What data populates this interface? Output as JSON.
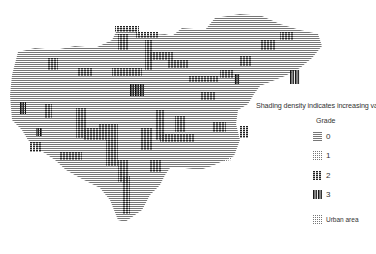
{
  "map": {
    "description": "Dot-matrix shaded map of a region showing graded areas",
    "colors": {
      "ink": "#222222",
      "background": "#ffffff"
    }
  },
  "legend": {
    "title": "Shading density indicates increasing va",
    "subtitle": "Grade",
    "items": [
      {
        "label": "0",
        "pattern": "horizontal-lines"
      },
      {
        "label": "1",
        "pattern": "light-dots"
      },
      {
        "label": "2",
        "pattern": "dense-blocks"
      },
      {
        "label": "3",
        "pattern": "vertical-bars"
      }
    ],
    "urban": {
      "label": "Urban area",
      "pattern": "dotted-grid"
    }
  }
}
